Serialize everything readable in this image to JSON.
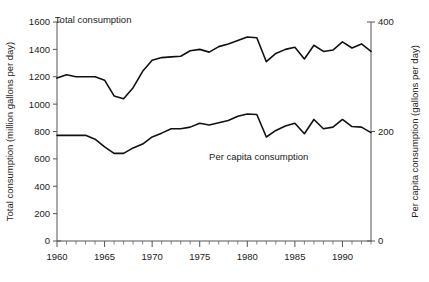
{
  "chart_data": {
    "type": "line",
    "title": "",
    "subtitle": "",
    "xlabel": "",
    "ylabel": "Total consumption (million gallons per day)",
    "y2label": "Per capita consumption (gallons per day)",
    "xlim": [
      1960,
      1993
    ],
    "ylim": [
      0,
      1600
    ],
    "y2lim": [
      0,
      400
    ],
    "grid": false,
    "legend_position": "inline-annotation",
    "xticks": [
      1960,
      1965,
      1970,
      1975,
      1980,
      1985,
      1990
    ],
    "xtick_labels": [
      "1960",
      "1965",
      "1970",
      "1975",
      "1980",
      "1985",
      "1990"
    ],
    "xminor_step": 1,
    "yticks": [
      0,
      200,
      400,
      600,
      800,
      1000,
      1200,
      1400,
      1600
    ],
    "ytick_labels": [
      "0",
      "200",
      "400",
      "600",
      "800",
      "1000",
      "1200",
      "1400",
      "1600"
    ],
    "y2ticks": [
      0,
      200,
      400
    ],
    "y2tick_labels": [
      "0",
      "200",
      "400"
    ],
    "x": [
      1960,
      1961,
      1962,
      1963,
      1964,
      1965,
      1966,
      1967,
      1968,
      1969,
      1970,
      1971,
      1972,
      1973,
      1974,
      1975,
      1976,
      1977,
      1978,
      1979,
      1980,
      1981,
      1982,
      1983,
      1984,
      1985,
      1986,
      1987,
      1988,
      1989,
      1990,
      1991,
      1992,
      1993
    ],
    "series": [
      {
        "name": "Total consumption",
        "axis": "left",
        "units": "million gallons per day",
        "annotation": "Total consumption",
        "values": [
          1190,
          1215,
          1200,
          1200,
          1200,
          1175,
          1060,
          1040,
          1120,
          1240,
          1320,
          1340,
          1345,
          1350,
          1390,
          1400,
          1380,
          1420,
          1440,
          1465,
          1490,
          1485,
          1310,
          1370,
          1400,
          1415,
          1330,
          1430,
          1385,
          1395,
          1455,
          1410,
          1440,
          1385
        ]
      },
      {
        "name": "Per capita consumption",
        "axis": "right",
        "units": "gallons per day",
        "annotation": "Per capita consumption",
        "values": [
          193,
          193,
          193,
          193,
          186,
          172,
          160,
          160,
          170,
          177,
          190,
          197,
          205,
          205,
          208,
          215,
          212,
          216,
          220,
          228,
          232,
          231,
          190,
          202,
          210,
          215,
          196,
          222,
          205,
          208,
          222,
          209,
          208,
          198
        ]
      }
    ],
    "annotations": [
      {
        "text": "Total consumption",
        "x": 1963.8,
        "y": 1590
      },
      {
        "text": "Per capita consumption",
        "x": 1981.2,
        "y": 590
      }
    ]
  }
}
